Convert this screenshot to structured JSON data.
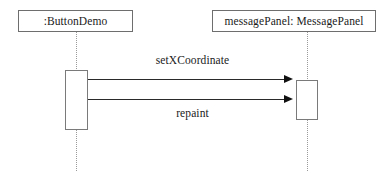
{
  "diagram": {
    "type": "uml-sequence-diagram",
    "canvas": {
      "width": 390,
      "height": 173,
      "background": "#ffffff"
    },
    "participants": [
      {
        "id": "buttondemo",
        "label": ":ButtonDemo",
        "role": "caller"
      },
      {
        "id": "messagepanel",
        "label": "messagePanel: MessagePanel",
        "role": "callee"
      }
    ],
    "messages": [
      {
        "id": "setxcoordinate",
        "label": "setXCoordinate",
        "from": "buttondemo",
        "to": "messagepanel",
        "order": 1,
        "arrow": "filled-solid",
        "direction": "left-to-right",
        "label_position": "above"
      },
      {
        "id": "repaint",
        "label": "repaint",
        "from": "buttondemo",
        "to": "messagepanel",
        "order": 2,
        "arrow": "filled-solid",
        "direction": "left-to-right",
        "label_position": "below"
      }
    ],
    "colors": {
      "box_border": "#6e6e6e",
      "lifeline": "#9a9a9a",
      "activation_border": "#7a7a7a",
      "message_line": "#2a2a2a",
      "arrowhead": "#111111",
      "text": "#1a1a1a"
    }
  }
}
